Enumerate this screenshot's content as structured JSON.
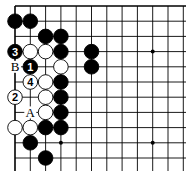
{
  "diagram": {
    "type": "go-board-corner",
    "grid": {
      "origin_x": 15,
      "origin_y": 6,
      "spacing_x": 15.3,
      "spacing_y": 15.2,
      "cols": 12,
      "rows": 11,
      "top_edge": true,
      "left_edge": true
    },
    "star_points": [
      {
        "col": 9,
        "row": 3
      },
      {
        "col": 3,
        "row": 9
      },
      {
        "col": 9,
        "row": 9
      }
    ],
    "stones": [
      {
        "color": "black",
        "col": 0,
        "row": 1
      },
      {
        "color": "black",
        "col": 1,
        "row": 1
      },
      {
        "color": "black",
        "col": 2,
        "row": 2
      },
      {
        "color": "black",
        "col": 3,
        "row": 2
      },
      {
        "color": "black",
        "col": 0,
        "row": 3,
        "label": "3"
      },
      {
        "color": "white",
        "col": 1,
        "row": 3
      },
      {
        "color": "white",
        "col": 2,
        "row": 3
      },
      {
        "color": "black",
        "col": 3,
        "row": 3
      },
      {
        "color": "black",
        "col": 5,
        "row": 3
      },
      {
        "color": "black",
        "col": 1,
        "row": 4,
        "label": "1"
      },
      {
        "color": "white",
        "col": 3,
        "row": 4
      },
      {
        "color": "black",
        "col": 5,
        "row": 4
      },
      {
        "color": "white",
        "col": 1,
        "row": 5,
        "label": "4"
      },
      {
        "color": "white",
        "col": 2,
        "row": 5
      },
      {
        "color": "black",
        "col": 3,
        "row": 5
      },
      {
        "color": "white",
        "col": 0,
        "row": 6,
        "label": "2"
      },
      {
        "color": "white",
        "col": 2,
        "row": 6
      },
      {
        "color": "black",
        "col": 3,
        "row": 6
      },
      {
        "color": "white",
        "col": 2,
        "row": 7
      },
      {
        "color": "black",
        "col": 3,
        "row": 7
      },
      {
        "color": "white",
        "col": 0,
        "row": 8
      },
      {
        "color": "white",
        "col": 1,
        "row": 8
      },
      {
        "color": "black",
        "col": 2,
        "row": 8
      },
      {
        "color": "black",
        "col": 3,
        "row": 8
      },
      {
        "color": "black",
        "col": 1,
        "row": 9
      },
      {
        "color": "black",
        "col": 2,
        "row": 10
      }
    ],
    "point_labels": [
      {
        "text": "B",
        "col": 0,
        "row": 4
      },
      {
        "text": "A",
        "col": 1,
        "row": 7
      }
    ],
    "colors": {
      "line": "#000000",
      "black_stone": "#000000",
      "white_stone": "#ffffff",
      "background": "#ffffff"
    }
  }
}
